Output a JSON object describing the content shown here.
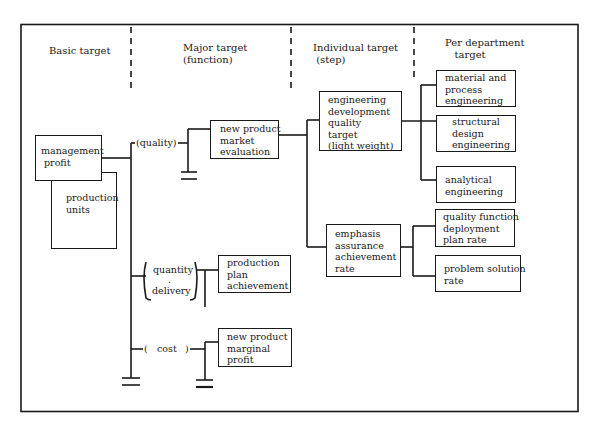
{
  "diagram": {
    "columns": [
      {
        "id": "basic",
        "label": "Basic target"
      },
      {
        "id": "major",
        "label": "Major target\n(function)"
      },
      {
        "id": "individual",
        "label": "Individual target\n (step)"
      },
      {
        "id": "department",
        "label": "Per department\n   target"
      }
    ],
    "basic_target": {
      "management_profit": "management\n profit",
      "production_units": "production\nunits"
    },
    "major_target": {
      "branches": [
        {
          "function": "(quality)",
          "target": "new product\nmarket\nevaluation"
        },
        {
          "function_top": "quantity",
          "function_dot": ".",
          "function_bottom": "delivery",
          "target": "production\nplan\nachievement"
        },
        {
          "function_open": "(",
          "function": "cost",
          "function_close": ")",
          "target": "new product\nmarginal\nprofit"
        }
      ]
    },
    "individual_target": {
      "steps": [
        "engineering\ndevelopment\nquality\ntarget\n(light weight)",
        "emphasis\nassurance\nachievement\nrate"
      ]
    },
    "per_department_target": {
      "engineering_group": [
        "material and\nprocess\nengineering",
        "structural\ndesign\nengineering",
        "analytical\nengineering"
      ],
      "assurance_group": [
        "quality function\ndeployment\nplan rate",
        "problem solution\nrate"
      ]
    }
  }
}
